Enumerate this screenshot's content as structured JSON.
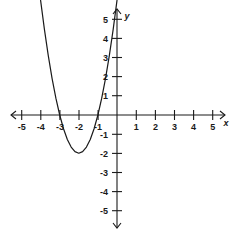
{
  "chart_data": {
    "type": "line",
    "title": "",
    "subtitle": "",
    "xlabel": "x",
    "ylabel": "y",
    "xlim": [
      -5.6,
      5.6
    ],
    "ylim": [
      -5.6,
      5.6
    ],
    "grid": false,
    "legend": null,
    "x_ticks": [
      -5,
      -4,
      -3,
      -2,
      -1,
      1,
      2,
      3,
      4,
      5
    ],
    "y_ticks": [
      5,
      4,
      3,
      2,
      1,
      -1,
      -2,
      -3,
      -4,
      -5
    ],
    "x_tick_labels": [
      "-5",
      "-4",
      "-3",
      "-2",
      "-1",
      "1",
      "2",
      "3",
      "4",
      "5"
    ],
    "y_tick_labels": [
      "5",
      "4",
      "3",
      "2",
      "1",
      "-1",
      "-2",
      "-3",
      "-4",
      "-5"
    ],
    "axis_style": "arrows-both-ends",
    "series": [
      {
        "name": "parabola",
        "equation": "y = 2(x + 2)^2 - 2",
        "expanded": "y = 2x^2 + 8x + 6",
        "vertex": [
          -2,
          -2
        ],
        "roots": [
          -3,
          -1
        ],
        "y_intercept": 6,
        "opens": "up",
        "color": "#1a1a1a",
        "x": [
          -4.0,
          -3.8,
          -3.6,
          -3.4,
          -3.2,
          -3.0,
          -2.8,
          -2.6,
          -2.4,
          -2.2,
          -2.0,
          -1.8,
          -1.6,
          -1.4,
          -1.2,
          -1.0,
          -0.8,
          -0.6,
          -0.4,
          -0.2,
          0.0
        ],
        "values": [
          6.0,
          4.48,
          3.12,
          1.92,
          0.88,
          0.0,
          -0.72,
          -1.28,
          -1.68,
          -1.92,
          -2.0,
          -1.92,
          -1.68,
          -1.28,
          -0.72,
          0.0,
          0.88,
          1.92,
          3.12,
          4.48,
          6.0
        ]
      }
    ],
    "annotations": []
  },
  "figure": {
    "background_color": "#ffffff",
    "axis_color": "#1a1a1a",
    "curve_color": "#1a1a1a",
    "x_axis_label": "x",
    "y_axis_label": "y"
  }
}
